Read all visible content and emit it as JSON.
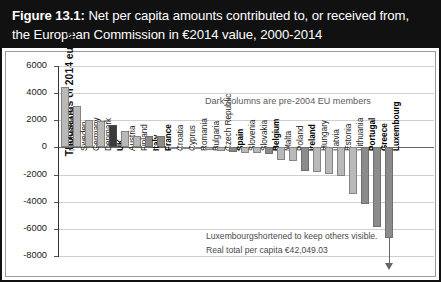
{
  "figure": {
    "label": "Figure 13.1:",
    "title_rest": " Net per capita amounts contributed to, or received from, the European Commission in €2014 value, 2000-2014"
  },
  "annotations": {
    "legend_note": "Dark columns are pre-2004 EU members",
    "note_line1": "Luxembourgshortened to keep others visible.",
    "note_line2": "Real total per capita €42,049.03"
  },
  "axis": {
    "ylabel": "Thousands of 2014 euros",
    "yticks": [
      "6000",
      "4000",
      "2000",
      "0",
      "-2000",
      "-4000",
      "-6000",
      "-8000"
    ]
  },
  "colors": {
    "light_bar": "#b9b9b9",
    "dark_bar": "#8b8b8b",
    "very_dark_bar": "#3b3b3b",
    "title_bg": "#111111",
    "grid": "#cfcfcf"
  },
  "chart_data": {
    "type": "bar",
    "title": "Figure 13.1: Net per capita amounts contributed to, or received from, the European Commission in €2014 value, 2000-2014",
    "xlabel": "",
    "ylabel": "Thousands of 2014 euros",
    "ylim": [
      -8000,
      6000
    ],
    "ytick_step": 2000,
    "grid": true,
    "legend": "Dark columns are pre-2004 EU members",
    "categories": [
      "Netherlands",
      "Sweden",
      "Germany",
      "Denmark",
      "UK",
      "Austria",
      "Finland",
      "Italy",
      "France",
      "Croatia",
      "Cyprus",
      "Romania",
      "Bulgaria",
      "Czech Republic",
      "Spain",
      "Slovenia",
      "Slovakia",
      "Belgium",
      "Malta",
      "Poland",
      "Ireland",
      "Hungary",
      "Latvia",
      "Estonia",
      "Lithuania",
      "Portugal",
      "Greece",
      "Luxembourg"
    ],
    "values": [
      4450,
      3040,
      2020,
      1960,
      1650,
      1180,
      820,
      840,
      820,
      -60,
      -90,
      -130,
      -180,
      -250,
      -320,
      -380,
      -430,
      -520,
      -900,
      -1020,
      -1750,
      -1850,
      -2000,
      -2120,
      -3450,
      -4150,
      -5900,
      -6700
    ],
    "shades": [
      "light",
      "light",
      "light",
      "light",
      "veryDark",
      "light",
      "light",
      "dark",
      "dark",
      "light",
      "light",
      "light",
      "light",
      "light",
      "dark",
      "light",
      "light",
      "dark",
      "light",
      "light",
      "dark",
      "light",
      "light",
      "light",
      "light",
      "dark",
      "dark",
      "dark"
    ],
    "pre2004_members": [
      "UK",
      "Italy",
      "France",
      "Spain",
      "Belgium",
      "Ireland",
      "Portugal",
      "Greece",
      "Luxembourg"
    ],
    "truncated_bar": "Luxembourg",
    "truncated_note": "Luxembourgshortened to keep others visible. Real total per capita €42,049.03"
  }
}
